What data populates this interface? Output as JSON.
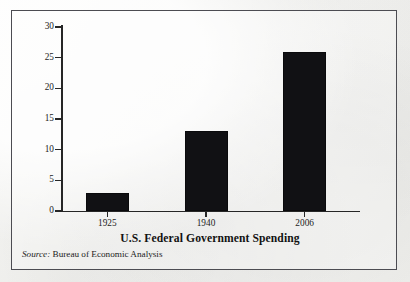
{
  "figure": {
    "source_label": "Source:",
    "source_text": " Bureau of Economic Analysis"
  },
  "chart_data": {
    "type": "bar",
    "title": "",
    "xlabel": "U.S. Federal Government Spending",
    "ylabel": "Percent of GDP",
    "categories": [
      "1925",
      "1940",
      "2006"
    ],
    "values": [
      3,
      13,
      26
    ],
    "ylim": [
      0,
      30
    ],
    "yticks": [
      0,
      5,
      10,
      15,
      20,
      25,
      30
    ],
    "ytick_labels": [
      "0",
      "5",
      "10",
      "15",
      "20",
      "25",
      "30"
    ],
    "grid": false,
    "legend": "none",
    "bar_color": "#111114",
    "axis_color": "#262626"
  }
}
